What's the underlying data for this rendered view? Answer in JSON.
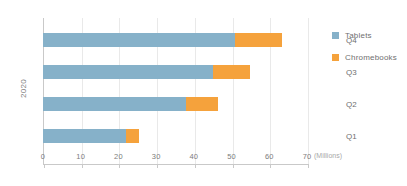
{
  "chart_data": {
    "type": "bar",
    "orientation": "horizontal",
    "stacked": true,
    "title": "",
    "xlabel": "(Millions)",
    "ylabel": "2020",
    "categories": [
      "Q1",
      "Q2",
      "Q3",
      "Q4"
    ],
    "series": [
      {
        "name": "Tablets",
        "color": "#86b1c9",
        "values": [
          22,
          38,
          45,
          51
        ]
      },
      {
        "name": "Chromebooks",
        "color": "#f5a23c",
        "values": [
          3.5,
          8.5,
          10,
          12.5
        ]
      }
    ],
    "totals": [
      25.5,
      46.5,
      55,
      63.5
    ],
    "xlim": [
      0,
      70
    ],
    "xticks": [
      0,
      10,
      20,
      30,
      40,
      50,
      60,
      70
    ],
    "xtick_labels": [
      "0",
      "10",
      "20",
      "30",
      "40",
      "50",
      "60",
      "70"
    ],
    "grid": "vertical",
    "legend_position": "right"
  },
  "axis": {
    "unit_label": "(Millions)",
    "y_title": "2020"
  },
  "legend": {
    "items": [
      {
        "label": "Tablets",
        "color": "#86b1c9"
      },
      {
        "label": "Chromebooks",
        "color": "#f5a23c"
      }
    ]
  },
  "colors": {
    "tablets": "#86b1c9",
    "chromebooks": "#f5a23c",
    "grid": "#e9e9e9",
    "axis": "#c9c9c9",
    "text": "#6f6f6f",
    "tick_text": "#7d7d7d",
    "unit_text": "#a8a8a8",
    "background": "#ffffff"
  }
}
